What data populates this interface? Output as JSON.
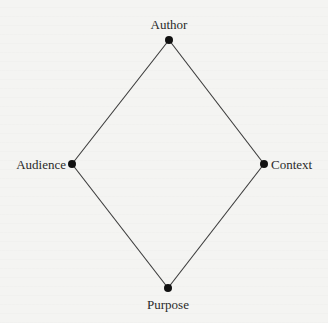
{
  "diagram": {
    "type": "rhetorical-diamond",
    "colors": {
      "background": "#f4f4f2",
      "line": "#3a3a3a",
      "node": "#111111",
      "text": "#2a2a2a"
    },
    "nodes": [
      {
        "id": "author",
        "label": "Author",
        "x": 169,
        "y": 40
      },
      {
        "id": "context",
        "label": "Context",
        "x": 264,
        "y": 164
      },
      {
        "id": "purpose",
        "label": "Purpose",
        "x": 168,
        "y": 288
      },
      {
        "id": "audience",
        "label": "Audience",
        "x": 72,
        "y": 164
      }
    ],
    "edges": [
      [
        "author",
        "context"
      ],
      [
        "context",
        "purpose"
      ],
      [
        "purpose",
        "audience"
      ],
      [
        "audience",
        "author"
      ]
    ]
  }
}
